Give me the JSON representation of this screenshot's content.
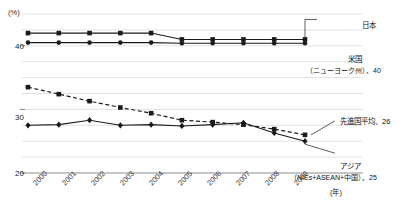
{
  "chart_data": {
    "type": "line",
    "title": "",
    "xlabel": "(年)",
    "ylabel": "(%)",
    "unit_y": "(%)",
    "unit_x": "(年)",
    "grid": true,
    "legend_position": "inline-right",
    "x": [
      "2000",
      "2001",
      "2002",
      "2003",
      "2004",
      "2005",
      "2006",
      "2007",
      "2008",
      "2009"
    ],
    "xlim": [
      2000,
      2009
    ],
    "ylim": [
      20,
      45
    ],
    "yticks": [
      20,
      30,
      40
    ],
    "ytick_labels": [
      "20",
      "30",
      "40"
    ],
    "gridlines": [
      22.5,
      25,
      27.5,
      30,
      32.5,
      35,
      37.5,
      40,
      42.5,
      45
    ],
    "series": [
      {
        "name": "日本",
        "marker": "square",
        "dash": false,
        "label": "日本",
        "end_value_label": "",
        "values": [
          42.0,
          42.0,
          42.0,
          42.0,
          42.0,
          41.0,
          41.0,
          41.0,
          41.0,
          41.0
        ]
      },
      {
        "name": "米国（ニューヨーク州）",
        "marker": "circle",
        "dash": false,
        "label": "米国",
        "label_sub": "（ニューヨーク州）、40",
        "end_value_label": "40",
        "values": [
          40.5,
          40.5,
          40.5,
          40.5,
          40.5,
          40.4,
          40.4,
          40.4,
          40.4,
          40.4
        ]
      },
      {
        "name": "先進国平均",
        "marker": "square",
        "dash": true,
        "label": "先進国平均、26",
        "end_value_label": "26",
        "values": [
          33.5,
          32.4,
          31.3,
          30.3,
          29.4,
          28.3,
          28.0,
          27.6,
          26.9,
          26.0
        ]
      },
      {
        "name": "アジア（NIEs+ASEAN+中国）",
        "marker": "diamond",
        "dash": false,
        "label": "アジア",
        "label_sub": "（NIEs+ASEAN+中国）、25",
        "end_value_label": "25",
        "values": [
          27.5,
          27.6,
          28.3,
          27.5,
          27.6,
          27.4,
          27.6,
          27.9,
          26.3,
          25.0
        ]
      }
    ],
    "annotations": [
      {
        "text": "日本",
        "target": "japan"
      },
      {
        "text": "米国",
        "target": "usa"
      },
      {
        "text": "（ニューヨーク州）、40",
        "target": "usa"
      },
      {
        "text": "先進国平均、26",
        "target": "developed"
      },
      {
        "text": "アジア",
        "target": "asia"
      },
      {
        "text": "（NIEs+ASEAN+中国）、25",
        "target": "asia"
      }
    ]
  },
  "axes": {
    "y_unit": "(%)",
    "x_unit": "(年)",
    "y_tick_40": "40",
    "y_tick_30": "30",
    "y_tick_20": "20"
  },
  "xticks": {
    "t0": "2000",
    "t1": "2001",
    "t2": "2002",
    "t3": "2003",
    "t4": "2004",
    "t5": "2005",
    "t6": "2006",
    "t7": "2007",
    "t8": "2008",
    "t9": "2009"
  },
  "labels": {
    "japan": "日本",
    "usa_line1": "米国",
    "usa_line2": "（ニューヨーク州）、40",
    "developed": "先進国平均、26",
    "asia_line1": "アジア",
    "asia_line2": "（NIEs+ASEAN+中国）、25"
  },
  "colors": {
    "line": "#1a1a1a",
    "grid": "#d9d9d9",
    "axis": "#8c8c8c",
    "text": "#1a1a1a"
  }
}
